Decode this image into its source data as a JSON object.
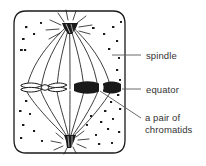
{
  "diagram": {
    "cell": {
      "name": "cell-outline",
      "shape": "rounded-rectangle",
      "stroke": "#1a1a1a",
      "fill": "#ffffff"
    },
    "structures": {
      "spindle": "spindle-fibres",
      "top_pole": "centriole-top",
      "bottom_pole": "centriole-bottom",
      "equator": "equator-plane",
      "chromosome_left": "chromosome-pair-outline",
      "chromosome_right": "chromosome-pair-solid",
      "granules": "cytoplasm-speckles"
    }
  },
  "labels": {
    "spindle": "spindle",
    "equator": "equator",
    "chromatids_line1": "a pair of",
    "chromatids_line2": "chromatids"
  },
  "colors": {
    "ink": "#1a1a1a",
    "text": "#333333",
    "leader": "#5a5a5a",
    "background": "#ffffff"
  }
}
